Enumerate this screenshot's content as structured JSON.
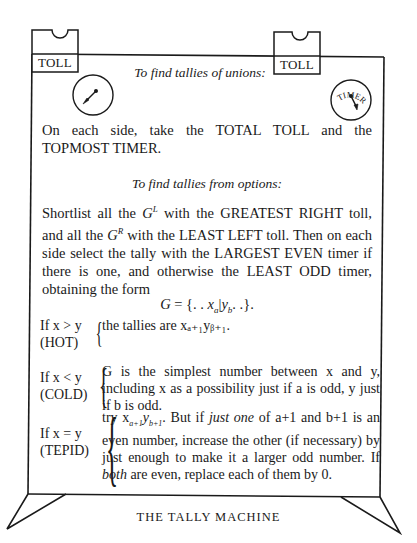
{
  "diagram": {
    "title": "THE TALLY MACHINE",
    "toll_tags": [
      {
        "label": "TOLL",
        "side": "left"
      },
      {
        "label": "TOLL",
        "side": "right"
      }
    ],
    "timers": [
      {
        "label": "TIMER",
        "side": "left"
      },
      {
        "label": "TIMER",
        "side": "right"
      }
    ]
  },
  "unions": {
    "heading": "To find tallies of unions:",
    "text": "On each side, take the TOTAL TOLL and the TOPMOST TIMER."
  },
  "options": {
    "heading": "To find tallies from options:",
    "text_parts": {
      "p1": "Shortlist all the ",
      "gl": "G",
      "gl_sup": "L",
      "p2": " with the GREATEST RIGHT toll, and all the ",
      "gr": "G",
      "gr_sup": "R",
      "p3": " with the LEAST LEFT toll. Then on each side select the tally with the LARGEST EVEN timer if there is one, and otherwise the LEAST ODD timer, obtaining the form"
    },
    "formula": {
      "lhs": "G",
      "eq": " = {. . ",
      "x": "x",
      "a": "a",
      "bar": "|",
      "y": "y",
      "b": "b",
      "tail": ". .}."
    }
  },
  "cases": [
    {
      "condition": "If x > y",
      "name": "(HOT)",
      "body": "the tallies are xₐ₊₁yᵦ₊₁."
    },
    {
      "condition": "If x < y",
      "name": "(COLD)",
      "body": "G is the simplest number between x and y, including x as a possibility just if a is odd, y just if b is odd."
    },
    {
      "condition": "If x = y",
      "name": "(TEPID)",
      "body_parts": {
        "p1": "try x",
        "s1": "a+1",
        "p2": "y",
        "s2": "b+1",
        "p3": ". But if ",
        "em1": "just one",
        "p4": " of a+1 and b+1 is an even number, increase the other (if necessary) by just enough to make it a larger odd number. If ",
        "em2": "both",
        "p5": " are even, replace each of them by 0."
      }
    }
  ],
  "caption": "THE TALLY MACHINE"
}
